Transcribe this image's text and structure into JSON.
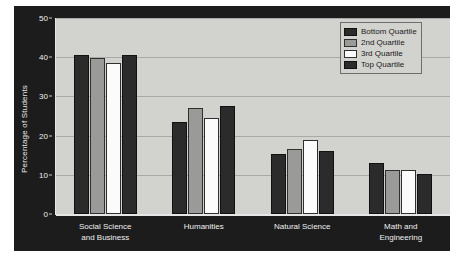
{
  "chart_data": {
    "type": "bar",
    "title": "",
    "xlabel": "",
    "ylabel": "Percentage of Students",
    "ylim": [
      0,
      50
    ],
    "yticks": [
      0,
      10,
      20,
      30,
      40,
      50
    ],
    "grid": true,
    "legend_position": "top-right",
    "categories": [
      "Social Science and Business",
      "Humanities",
      "Natural Science",
      "Math and Engineering"
    ],
    "category_lines": [
      [
        "Social Science",
        "and Business"
      ],
      [
        "Humanities"
      ],
      [
        "Natural Science"
      ],
      [
        "Math and",
        "Engineering"
      ]
    ],
    "series": [
      {
        "name": "Bottom Quartile",
        "swatch": "dark",
        "color": "#2b2b2b",
        "values": [
          40.5,
          23.5,
          15.2,
          13.0
        ]
      },
      {
        "name": "2nd Quartile",
        "swatch": "gray",
        "color": "#9a9a98",
        "values": [
          39.8,
          27.0,
          16.5,
          11.2
        ]
      },
      {
        "name": "3rd Quartile",
        "swatch": "white",
        "color": "#fbfbfb",
        "values": [
          38.5,
          24.5,
          19.0,
          11.2
        ]
      },
      {
        "name": "Top Quartile",
        "swatch": "dark",
        "color": "#2b2b2b",
        "values": [
          40.5,
          27.5,
          16.0,
          10.3
        ]
      }
    ]
  },
  "colors": {
    "panel_background": "#1c1c1c",
    "plot_background": "#d2d2ce",
    "gridline": "#a9a9a5",
    "axis": "#e6e6e6",
    "tick_text": "#f0f0f0",
    "legend_background": "#d2d2ce",
    "legend_border": "#6e6e6e"
  }
}
